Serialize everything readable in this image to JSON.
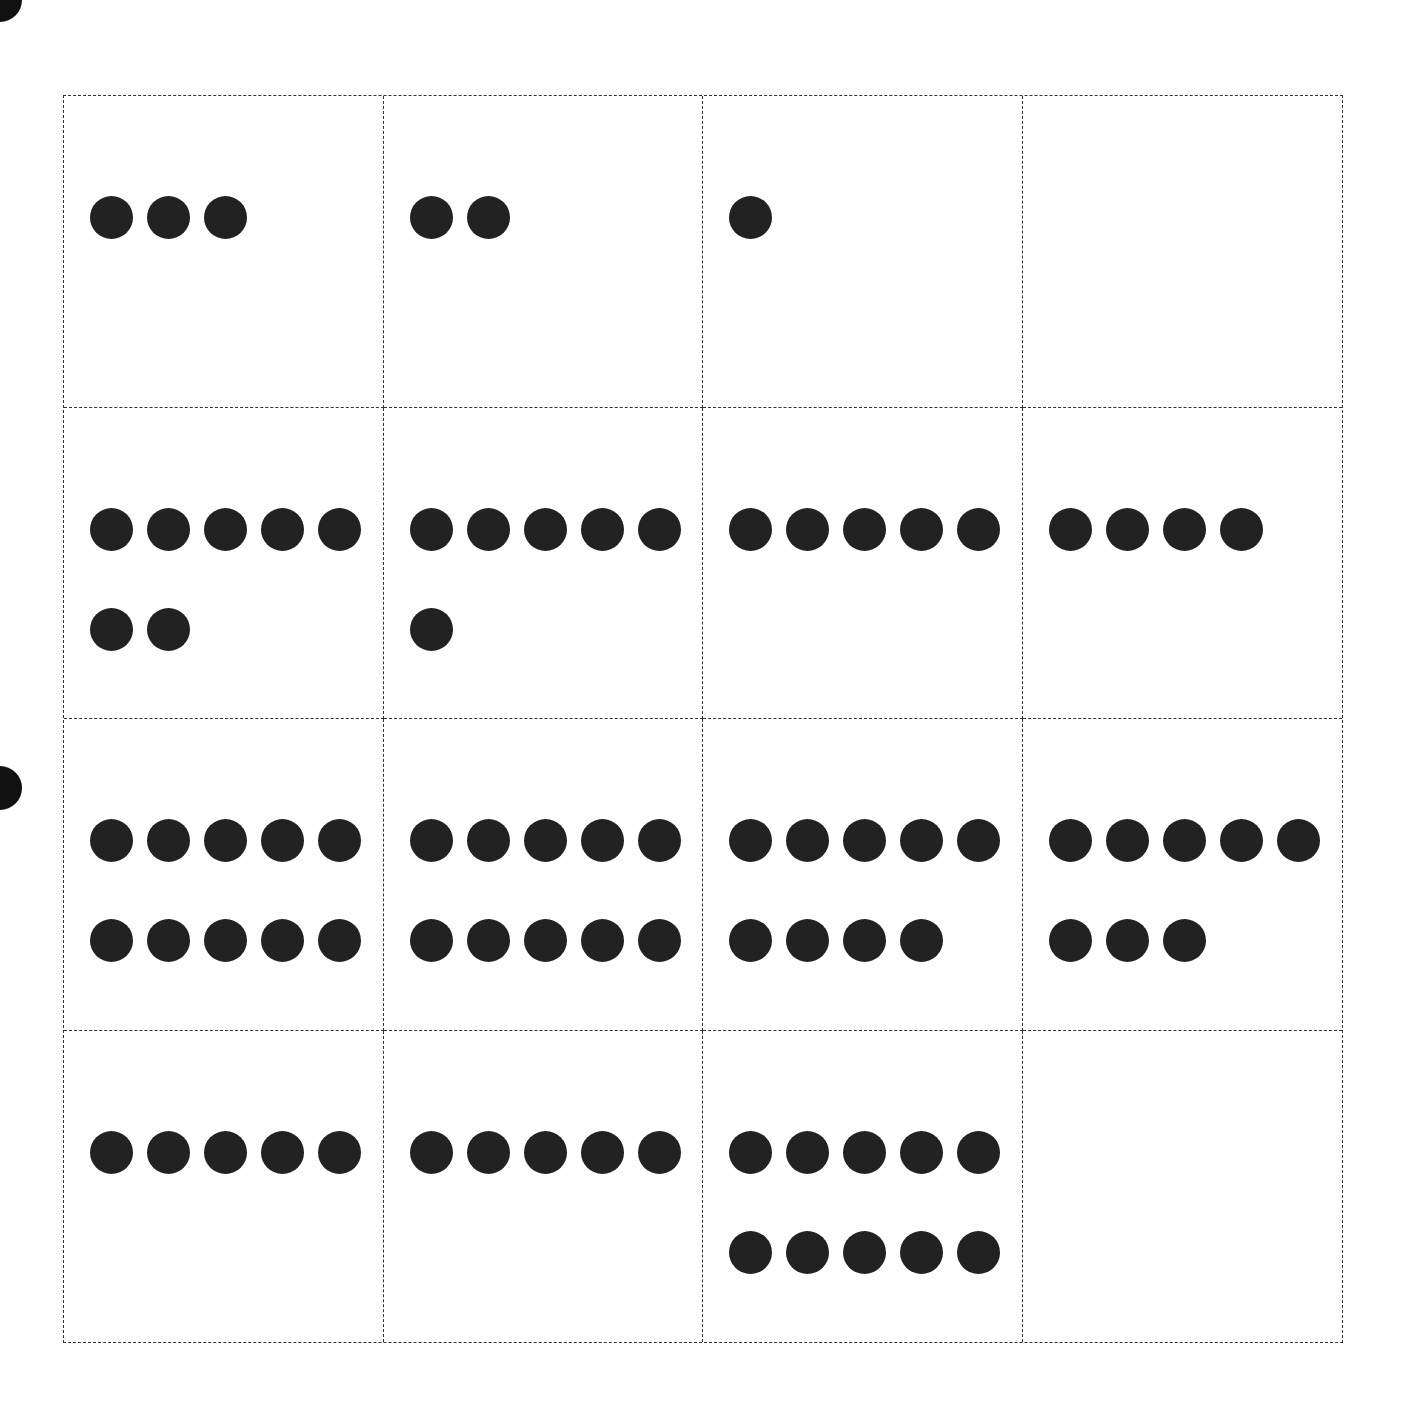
{
  "worksheet": {
    "type": "dot card grid",
    "rows": 4,
    "columns": 4,
    "cells": [
      {
        "count": 3
      },
      {
        "count": 2
      },
      {
        "count": 1
      },
      {
        "count": 0
      },
      {
        "count": 7
      },
      {
        "count": 6
      },
      {
        "count": 5
      },
      {
        "count": 4
      },
      {
        "count": 10
      },
      {
        "count": 10
      },
      {
        "count": 9
      },
      {
        "count": 8
      },
      {
        "count": 5
      },
      {
        "count": 5
      },
      {
        "count": 10
      },
      {
        "count": 0
      }
    ],
    "dots_per_row": 5,
    "colors": {
      "dot": "#222222",
      "border": "#333333",
      "background": "#ffffff"
    }
  },
  "punch_holes": [
    {
      "x": -22,
      "y": -22
    },
    {
      "x": -22,
      "y": 766
    }
  ]
}
